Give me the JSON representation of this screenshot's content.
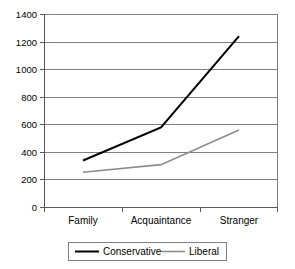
{
  "chart_data": {
    "type": "line",
    "title": "",
    "subtitle": "",
    "xlabel": "",
    "ylabel": "",
    "categories": [
      "Family",
      "Acquaintance",
      "Stranger"
    ],
    "series": [
      {
        "name": "Conservative",
        "values": [
          340,
          580,
          1240
        ],
        "color": "#000000"
      },
      {
        "name": "Liberal",
        "values": [
          255,
          310,
          560
        ],
        "color": "#8c8c8c"
      }
    ],
    "ylim": [
      0,
      1400
    ],
    "yticks": [
      0,
      200,
      400,
      600,
      800,
      1000,
      1200,
      1400
    ],
    "ytick_labels": [
      "0",
      "200",
      "400",
      "600",
      "800",
      "1000",
      "1200",
      "1400"
    ],
    "grid": "horizontal",
    "legend_position": "bottom",
    "legend_entries": [
      "Conservative",
      "Liberal"
    ]
  },
  "axis": {
    "y": {
      "t0": "1400",
      "t1": "1200",
      "t2": "1000",
      "t3": "800",
      "t4": "600",
      "t5": "400",
      "t6": "200",
      "t7": "0"
    },
    "x": {
      "c0": "Family",
      "c1": "Acquaintance",
      "c2": "Stranger"
    }
  },
  "legend": {
    "items": [
      {
        "label": "Conservative"
      },
      {
        "label": "Liberal"
      }
    ]
  }
}
